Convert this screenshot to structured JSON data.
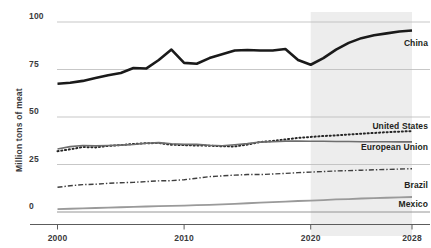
{
  "chart_data": {
    "type": "line",
    "title": "",
    "subtitle": "",
    "xlabel": "",
    "ylabel": "Million tons of meat",
    "xlim": [
      2000,
      2028
    ],
    "ylim": [
      0,
      100
    ],
    "grid": true,
    "legend_position": "right-inline",
    "y_ticks": [
      {
        "value": 100,
        "label": "100"
      },
      {
        "value": 75,
        "label": "75"
      },
      {
        "value": 50,
        "label": "50"
      },
      {
        "value": 25,
        "label": "25"
      },
      {
        "value": 0,
        "label": "0"
      }
    ],
    "x_ticks": [
      {
        "value": 2000,
        "label": "2000"
      },
      {
        "value": 2010,
        "label": "2010"
      },
      {
        "value": 2020,
        "label": "2020"
      },
      {
        "value": 2028,
        "label": "2028"
      }
    ],
    "annotations": [
      {
        "name": "forecast-shading",
        "type": "vspan",
        "x_start": 2020,
        "x_end": 2028,
        "color": "#ededed"
      }
    ],
    "x": [
      2000,
      2001,
      2002,
      2003,
      2004,
      2005,
      2006,
      2007,
      2008,
      2009,
      2010,
      2011,
      2012,
      2013,
      2014,
      2015,
      2016,
      2017,
      2018,
      2019,
      2020,
      2021,
      2022,
      2023,
      2024,
      2025,
      2026,
      2027,
      2028
    ],
    "series": [
      {
        "name": "China",
        "label": "China",
        "color": "#1a1a1a",
        "style": "solid",
        "width": 2.6,
        "values": [
          67.5,
          68.0,
          69.0,
          70.5,
          72.0,
          73.2,
          75.8,
          75.5,
          80.0,
          85.5,
          78.5,
          78.0,
          81.0,
          83.0,
          85.0,
          85.3,
          85.0,
          85.0,
          85.8,
          80.0,
          77.5,
          81.0,
          85.5,
          89.0,
          91.5,
          93.0,
          94.0,
          95.0,
          95.5
        ]
      },
      {
        "name": "United States",
        "label": "United States",
        "color": "#262626",
        "style": "dotted",
        "width": 2.0,
        "values": [
          32.0,
          33.0,
          34.2,
          34.0,
          34.8,
          35.2,
          35.8,
          36.2,
          36.3,
          35.4,
          35.2,
          35.0,
          34.9,
          34.6,
          34.5,
          35.5,
          36.8,
          37.4,
          38.2,
          39.0,
          39.5,
          40.0,
          40.3,
          40.8,
          41.2,
          41.6,
          42.0,
          42.3,
          42.6
        ]
      },
      {
        "name": "European Union",
        "label": "European Union",
        "color": "#6e6e6e",
        "style": "solid",
        "width": 1.6,
        "values": [
          33.2,
          34.4,
          35.0,
          34.8,
          35.0,
          35.2,
          35.5,
          36.2,
          36.5,
          35.9,
          35.6,
          35.6,
          35.1,
          34.9,
          35.4,
          36.0,
          36.8,
          37.0,
          37.3,
          37.3,
          37.2,
          37.2,
          37.1,
          37.1,
          37.0,
          37.0,
          37.0,
          36.9,
          36.9
        ]
      },
      {
        "name": "Brazil",
        "label": "Brazil",
        "color": "#3f3f3f",
        "style": "dashdot",
        "width": 1.4,
        "values": [
          13.0,
          13.8,
          14.4,
          14.6,
          15.1,
          15.4,
          15.6,
          16.0,
          16.4,
          16.5,
          17.0,
          17.8,
          18.6,
          19.0,
          19.4,
          19.7,
          19.7,
          20.0,
          20.3,
          20.7,
          21.0,
          21.3,
          21.6,
          21.8,
          22.0,
          22.2,
          22.4,
          22.6,
          22.8
        ]
      },
      {
        "name": "Mexico",
        "label": "Mexico",
        "color": "#9a9a9a",
        "style": "solid",
        "width": 1.8,
        "values": [
          1.5,
          1.7,
          1.9,
          2.1,
          2.3,
          2.5,
          2.7,
          2.9,
          3.1,
          3.2,
          3.4,
          3.6,
          3.8,
          4.0,
          4.3,
          4.6,
          4.9,
          5.2,
          5.5,
          5.8,
          6.0,
          6.3,
          6.6,
          6.8,
          7.1,
          7.3,
          7.5,
          7.7,
          7.9
        ]
      }
    ]
  }
}
